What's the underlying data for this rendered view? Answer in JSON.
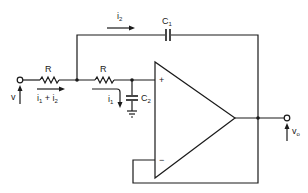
{
  "diagram": {
    "type": "circuit-schematic",
    "components": {
      "r1": {
        "label": "R"
      },
      "r2": {
        "label": "R"
      },
      "c1": {
        "label": "C",
        "subscript": "1"
      },
      "c2": {
        "label": "C",
        "subscript": "2"
      },
      "opamp": {
        "plus_label": "+",
        "minus_label": "−"
      }
    },
    "signals": {
      "input": {
        "label": "v"
      },
      "output": {
        "label": "v",
        "subscript": "o"
      }
    },
    "currents": {
      "i2": {
        "label": "i",
        "subscript": "2"
      },
      "i1": {
        "label": "i",
        "subscript": "1"
      },
      "i1_plus_i2": {
        "label_a": "i",
        "sub_a": "1",
        "op": " + ",
        "label_b": "i",
        "sub_b": "2"
      }
    },
    "colors": {
      "line": "#1a1a1a",
      "background": "#ffffff"
    }
  }
}
